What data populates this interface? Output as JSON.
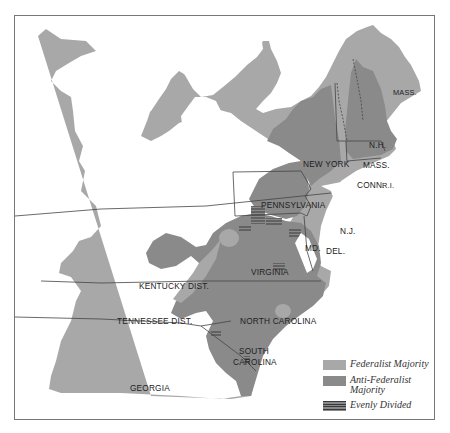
{
  "map": {
    "colors": {
      "federalist": "#a8a8a8",
      "anti_federalist": "#8a8a8a",
      "evenly_divided": "#6f6f6f",
      "water": "#ffffff",
      "border": "#555555"
    },
    "labels": {
      "mass_maine": "MASS.",
      "nh": "N.H.",
      "mass": "MASS.",
      "conn": "CONN.",
      "ri": "R.I.",
      "new_york": "NEW YORK",
      "pennsylvania": "PENNSYLVANIA",
      "nj": "N.J.",
      "md": "MD.",
      "del": "DEL.",
      "virginia": "VIRGINIA",
      "kentucky": "KENTUCKY DIST.",
      "tennessee": "TENNESSEE DIST.",
      "north_carolina": "NORTH CAROLINA",
      "south_carolina_1": "SOUTH",
      "south_carolina_2": "CAROLINA",
      "georgia": "GEORGIA"
    }
  },
  "legend": {
    "items": [
      {
        "label": "Federalist Majority",
        "color": "#a8a8a8"
      },
      {
        "label": "Anti-Federalist Majority",
        "color": "#8a8a8a"
      },
      {
        "label": "Evenly Divided",
        "color": "#6f6f6f"
      }
    ]
  }
}
